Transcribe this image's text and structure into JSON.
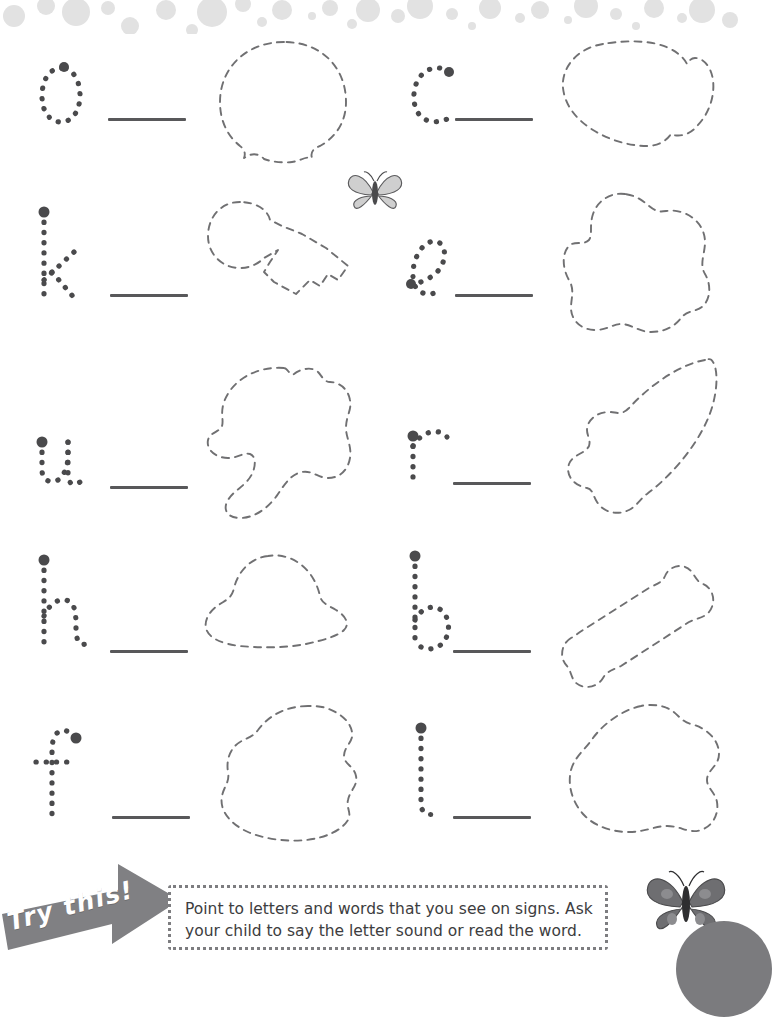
{
  "page": {
    "kind": "handwriting-worksheet"
  },
  "decor": {
    "top_band_color": "#e2e2e2",
    "bubbles": [
      {
        "x": 14,
        "y": 6,
        "r": 11
      },
      {
        "x": 46,
        "y": -4,
        "r": 9
      },
      {
        "x": 76,
        "y": 2,
        "r": 14
      },
      {
        "x": 108,
        "y": -2,
        "r": 7
      },
      {
        "x": 130,
        "y": 16,
        "r": 9
      },
      {
        "x": 166,
        "y": 0,
        "r": 10
      },
      {
        "x": 192,
        "y": 20,
        "r": 6
      },
      {
        "x": 212,
        "y": 2,
        "r": 15
      },
      {
        "x": 243,
        "y": -6,
        "r": 8
      },
      {
        "x": 262,
        "y": 12,
        "r": 5
      },
      {
        "x": 282,
        "y": 0,
        "r": 10
      },
      {
        "x": 312,
        "y": 6,
        "r": 4
      },
      {
        "x": 330,
        "y": -2,
        "r": 8
      },
      {
        "x": 352,
        "y": 14,
        "r": 5
      },
      {
        "x": 368,
        "y": 0,
        "r": 12
      },
      {
        "x": 398,
        "y": 6,
        "r": 7
      },
      {
        "x": 420,
        "y": -4,
        "r": 13
      },
      {
        "x": 452,
        "y": 4,
        "r": 6
      },
      {
        "x": 472,
        "y": 16,
        "r": 4
      },
      {
        "x": 490,
        "y": -2,
        "r": 11
      },
      {
        "x": 520,
        "y": 8,
        "r": 5
      },
      {
        "x": 540,
        "y": 0,
        "r": 9
      },
      {
        "x": 568,
        "y": 10,
        "r": 4
      },
      {
        "x": 586,
        "y": -4,
        "r": 12
      },
      {
        "x": 616,
        "y": 4,
        "r": 6
      },
      {
        "x": 636,
        "y": 16,
        "r": 4
      },
      {
        "x": 654,
        "y": -2,
        "r": 10
      },
      {
        "x": 682,
        "y": 8,
        "r": 5
      },
      {
        "x": 702,
        "y": 0,
        "r": 13
      },
      {
        "x": 730,
        "y": 10,
        "r": 8
      }
    ]
  },
  "rows": [
    {
      "left": {
        "letter": "o",
        "picture": "balloon",
        "line_label": "writing-line"
      },
      "right": {
        "letter": "c",
        "picture": "cloud",
        "line_label": "writing-line"
      }
    },
    {
      "left": {
        "letter": "k",
        "picture": "key",
        "line_label": "writing-line"
      },
      "right": {
        "letter": "e",
        "picture": "blob",
        "line_label": "writing-line"
      }
    },
    {
      "left": {
        "letter": "u",
        "picture": "umbrella",
        "line_label": "writing-line"
      },
      "right": {
        "letter": "r",
        "picture": "rocket",
        "line_label": "writing-line"
      }
    },
    {
      "left": {
        "letter": "h",
        "picture": "hat",
        "line_label": "writing-line"
      },
      "right": {
        "letter": "b",
        "picture": "bone",
        "line_label": "writing-line"
      }
    },
    {
      "left": {
        "letter": "f",
        "picture": "fish",
        "line_label": "writing-line"
      },
      "right": {
        "letter": "l",
        "picture": "leaf",
        "line_label": "writing-line"
      }
    }
  ],
  "butterflies": [
    {
      "name": "butterfly-top",
      "shade": "light"
    },
    {
      "name": "butterfly-bottom",
      "shade": "dark"
    }
  ],
  "tip": {
    "banner_label": "Try this!",
    "text": "Point to letters and words that you see on signs. Ask your child to say the letter sound or read the word.",
    "banner_color": "#808083",
    "border_color": "#7d7d80"
  }
}
